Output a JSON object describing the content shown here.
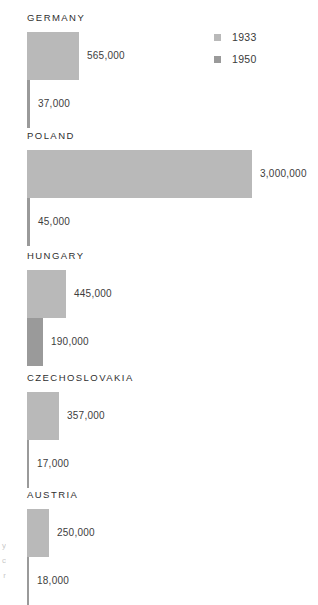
{
  "chart_data": {
    "type": "bar",
    "title": "",
    "xlabel": "",
    "ylabel": "",
    "orientation": "horizontal",
    "grid": false,
    "legend_position": "top-right",
    "categories": [
      "GERMANY",
      "POLAND",
      "HUNGARY",
      "CZECHOSLOVAKIA",
      "AUSTRIA"
    ],
    "series": [
      {
        "name": "1933",
        "color": "#b9b9b9",
        "values": [
          565000,
          3000000,
          445000,
          357000,
          250000
        ],
        "value_labels": [
          "565,000",
          "3,000,000",
          "445,000",
          "357,000",
          "250,000"
        ]
      },
      {
        "name": "1950",
        "color": "#9a9a9a",
        "values": [
          37000,
          45000,
          190000,
          17000,
          18000
        ],
        "value_labels": [
          "37,000",
          "45,000",
          "190,000",
          "17,000",
          "18,000"
        ]
      }
    ],
    "xlim": [
      0,
      3000000
    ],
    "max_bar_px": 225
  },
  "legend": {
    "items": [
      {
        "label": "1933",
        "color": "#b9b9b9"
      },
      {
        "label": "1950",
        "color": "#9a9a9a"
      }
    ]
  },
  "groups": [
    {
      "name": "GERMANY",
      "bars": [
        {
          "series": "1933",
          "value_label": "565,000",
          "width_px": 52,
          "color": "#b9b9b9"
        },
        {
          "series": "1950",
          "value_label": "37,000",
          "width_px": 3,
          "color": "#9a9a9a"
        }
      ]
    },
    {
      "name": "POLAND",
      "bars": [
        {
          "series": "1933",
          "value_label": "3,000,000",
          "width_px": 225,
          "color": "#b9b9b9"
        },
        {
          "series": "1950",
          "value_label": "45,000",
          "width_px": 3,
          "color": "#9a9a9a"
        }
      ]
    },
    {
      "name": "HUNGARY",
      "bars": [
        {
          "series": "1933",
          "value_label": "445,000",
          "width_px": 39,
          "color": "#b9b9b9"
        },
        {
          "series": "1950",
          "value_label": "190,000",
          "width_px": 16,
          "color": "#9a9a9a"
        }
      ]
    },
    {
      "name": "CZECHOSLOVAKIA",
      "bars": [
        {
          "series": "1933",
          "value_label": "357,000",
          "width_px": 32,
          "color": "#b9b9b9"
        },
        {
          "series": "1950",
          "value_label": "17,000",
          "width_px": 2,
          "color": "#9a9a9a"
        }
      ]
    },
    {
      "name": "AUSTRIA",
      "bars": [
        {
          "series": "1933",
          "value_label": "250,000",
          "width_px": 22,
          "color": "#b9b9b9"
        },
        {
          "series": "1950",
          "value_label": "18,000",
          "width_px": 2,
          "color": "#9a9a9a"
        }
      ]
    }
  ],
  "edge_text": {
    "line1": "y",
    "line2": "c",
    "line3": "r"
  }
}
